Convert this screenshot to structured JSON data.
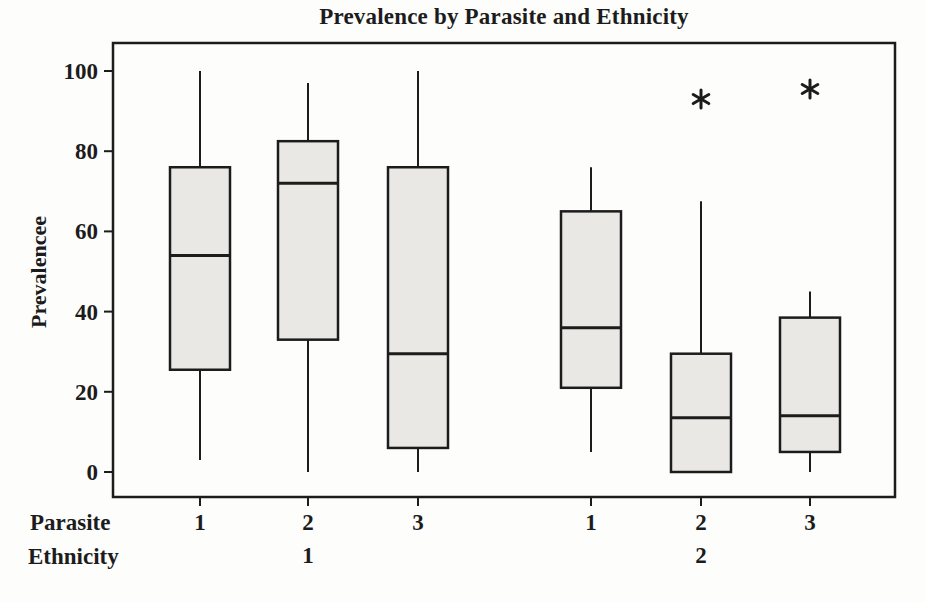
{
  "chart_data": {
    "type": "boxplot",
    "title": "Prevalence by Parasite and Ethnicity",
    "ylabel": "Prevalencee",
    "xlabel": "",
    "ylim": [
      0,
      100
    ],
    "yticks": [
      0,
      20,
      40,
      60,
      80,
      100
    ],
    "grid": false,
    "legend": "none",
    "x_axis_rows": [
      {
        "label": "Parasite",
        "values": [
          "1",
          "2",
          "3",
          "1",
          "2",
          "3"
        ]
      },
      {
        "label": "Ethnicity",
        "values": [
          "1",
          "2"
        ]
      }
    ],
    "groups": [
      {
        "ethnicity": "1",
        "boxes": [
          {
            "parasite": "1",
            "whisker_low": 3,
            "q1": 25.5,
            "median": 54,
            "q3": 76,
            "whisker_high": 100,
            "outliers": []
          },
          {
            "parasite": "2",
            "whisker_low": 0,
            "q1": 33,
            "median": 72,
            "q3": 82.5,
            "whisker_high": 97,
            "outliers": []
          },
          {
            "parasite": "3",
            "whisker_low": 0,
            "q1": 6,
            "median": 29.5,
            "q3": 76,
            "whisker_high": 100,
            "outliers": []
          }
        ]
      },
      {
        "ethnicity": "2",
        "boxes": [
          {
            "parasite": "1",
            "whisker_low": 5,
            "q1": 21,
            "median": 36,
            "q3": 65,
            "whisker_high": 76,
            "outliers": []
          },
          {
            "parasite": "2",
            "whisker_low": 0,
            "q1": 0,
            "median": 13.5,
            "q3": 29.5,
            "whisker_high": 67.5,
            "outliers": [
              93
            ]
          },
          {
            "parasite": "3",
            "whisker_low": 0,
            "q1": 5,
            "median": 14,
            "q3": 38.5,
            "whisker_high": 45,
            "outliers": [
              95.5
            ]
          }
        ]
      }
    ],
    "style": {
      "box_fill": "#e9e8e4",
      "stroke": "#1c1c1c",
      "background": "#fdfdfc",
      "outlier_symbol": "asterisk"
    }
  }
}
